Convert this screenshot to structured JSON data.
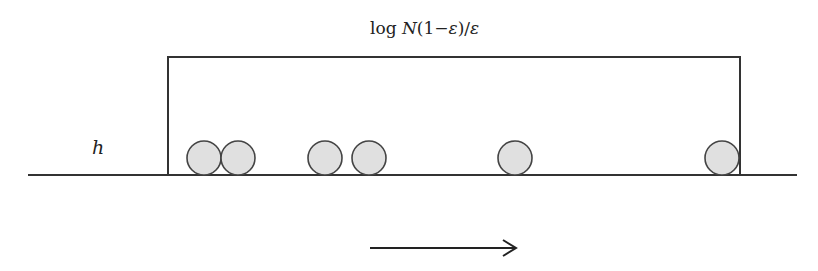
{
  "diagram": {
    "title_label": "log N(1−ε)/ε",
    "title_parts": {
      "log": "log ",
      "N": "N",
      "rest": "(1−",
      "eps1": "ε",
      "close": ")/",
      "eps2": "ε"
    },
    "height_label": "h",
    "colors": {
      "stroke": "#333333",
      "circle_fill": "#e0e0e0",
      "circle_stroke": "#444444",
      "background": "#ffffff"
    },
    "baseline": {
      "x1": 28,
      "x2": 797,
      "y": 175
    },
    "box": {
      "left": 168,
      "right": 740,
      "top": 57,
      "bottom": 175
    },
    "circles": [
      {
        "cx": 204,
        "cy": 158,
        "r": 17
      },
      {
        "cx": 238,
        "cy": 158,
        "r": 17
      },
      {
        "cx": 325,
        "cy": 158,
        "r": 17
      },
      {
        "cx": 369,
        "cy": 158,
        "r": 17
      },
      {
        "cx": 515,
        "cy": 158,
        "r": 17
      },
      {
        "cx": 722,
        "cy": 158,
        "r": 17
      }
    ],
    "arrow": {
      "x1": 370,
      "x2": 517,
      "y": 248,
      "direction": "right"
    }
  }
}
